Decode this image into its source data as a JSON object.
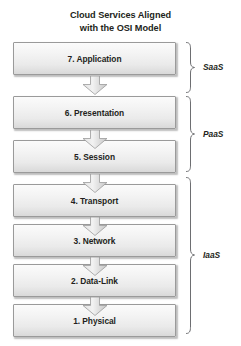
{
  "figure": {
    "title_line1": "Cloud Services Aligned",
    "title_line2": "with the OSI Model"
  },
  "layers": [
    {
      "label": "7. Application"
    },
    {
      "label": "6. Presentation"
    },
    {
      "label": "5. Session"
    },
    {
      "label": "4. Transport"
    },
    {
      "label": "3. Network"
    },
    {
      "label": "2. Data-Link"
    },
    {
      "label": "1. Physical"
    }
  ],
  "groups": [
    {
      "label": "SaaS"
    },
    {
      "label": "PaaS"
    },
    {
      "label": "IaaS"
    }
  ],
  "colors": {
    "box_border": "#9a9a9a",
    "box_fill_top": "#fbfbfb",
    "box_fill_bottom": "#d9d9d9",
    "text": "#231f20",
    "arrow_border": "#9a9a9a",
    "brace": "#6d6e71"
  }
}
